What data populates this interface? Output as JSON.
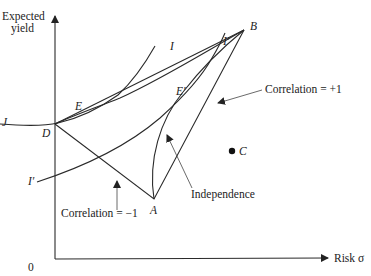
{
  "diagram": {
    "axes": {
      "y_label_line1": "Expected",
      "y_label_line2": "yield",
      "x_label": "Risk σ",
      "origin": "0"
    },
    "points": {
      "A": "A",
      "B": "B",
      "C": "C",
      "D": "D",
      "E": "E",
      "E_prime": "E′"
    },
    "curves": {
      "I_upper_left": "I",
      "I_upper_right": "I",
      "I_prime_top": "I′",
      "I_prime_left": "I′"
    },
    "annotations": {
      "corr_plus": "Correlation = +1",
      "corr_minus": "Correlation = −1",
      "independence": "Independence"
    },
    "colors": {
      "line": "#2a2a2a",
      "background": "#ffffff"
    }
  }
}
